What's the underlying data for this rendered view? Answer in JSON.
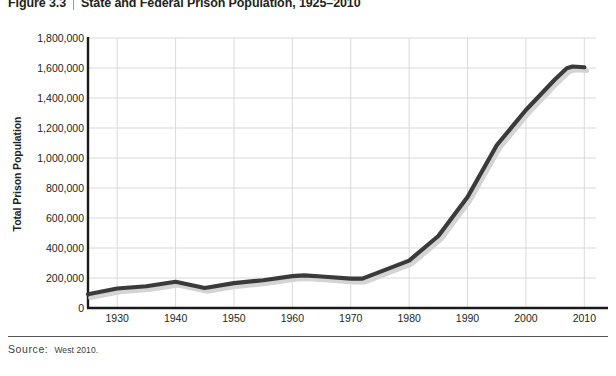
{
  "figure": {
    "number": "Figure 3.3",
    "title": "State and Federal Prison Population, 1925–2010"
  },
  "source": {
    "label": "Source:",
    "text": "West 2010."
  },
  "style": {
    "line_color": "#3a3a3a",
    "shadow_color": "#d4d4d4",
    "grid_color": "#d9d9d9",
    "axis_color": "#1a1a1a",
    "background": "#ffffff"
  },
  "chart_data": {
    "type": "line",
    "title": "State and Federal Prison Population, 1925–2010",
    "xlabel": "",
    "ylabel": "Total Prison Population",
    "xlim": [
      1925,
      2012
    ],
    "ylim": [
      0,
      1800000
    ],
    "grid": true,
    "legend": null,
    "x_ticks": [
      1930,
      1940,
      1950,
      1960,
      1970,
      1980,
      1990,
      2000,
      2010
    ],
    "y_ticks": [
      0,
      200000,
      400000,
      600000,
      800000,
      1000000,
      1200000,
      1400000,
      1600000,
      1800000
    ],
    "y_tick_labels": [
      "0",
      "200,000",
      "400,000",
      "600,000",
      "800,000",
      "1,000,000",
      "1,200,000",
      "1,400,000",
      "1,600,000",
      "1,800,000"
    ],
    "x_tick_labels": [
      "1930",
      "1940",
      "1950",
      "1960",
      "1970",
      "1980",
      "1990",
      "2000",
      "2010"
    ],
    "series": [
      {
        "name": "Total Prison Population",
        "x": [
          1925,
          1930,
          1935,
          1940,
          1945,
          1950,
          1955,
          1960,
          1962,
          1965,
          1970,
          1972,
          1975,
          1980,
          1985,
          1990,
          1995,
          2000,
          2005,
          2007,
          2008,
          2010
        ],
        "values": [
          92000,
          130000,
          145000,
          175000,
          133000,
          166000,
          185000,
          213000,
          218000,
          210000,
          196000,
          196000,
          241000,
          316000,
          480000,
          740000,
          1085000,
          1320000,
          1525000,
          1598000,
          1610000,
          1605000
        ]
      }
    ]
  }
}
